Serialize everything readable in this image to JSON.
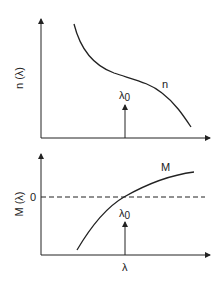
{
  "top_panel": {
    "ylabel": "n (λ)",
    "curve_label": "n",
    "marker_label": "λ",
    "marker_subscript": "0",
    "description": "Refractive index n decreasing with wavelength, inflection near λ0"
  },
  "bottom_panel": {
    "ylabel": "M (λ)",
    "zero_tick": "0",
    "curve_label": "M",
    "marker_label": "λ",
    "marker_subscript": "0",
    "xlabel": "λ",
    "description": "Material dispersion M crossing zero at λ0"
  },
  "colors": {
    "line": "#222222",
    "background": "#ffffff"
  }
}
